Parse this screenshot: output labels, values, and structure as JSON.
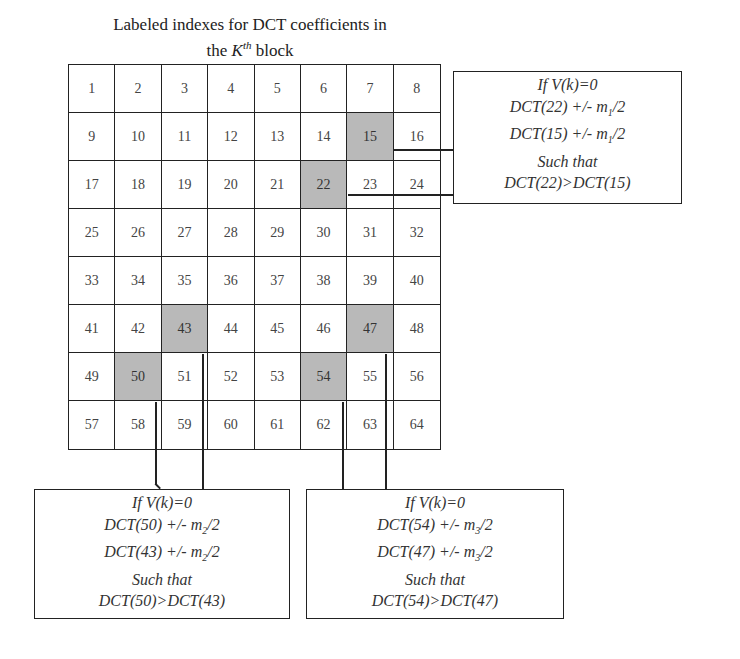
{
  "title": {
    "line1": "Labeled indexes for DCT coefficients in",
    "line2_prefix": "the ",
    "line2_var": "K",
    "line2_sup": "th",
    "line2_suffix": " block"
  },
  "grid": {
    "rows": 8,
    "cols": 8,
    "cells": [
      "1",
      "2",
      "3",
      "4",
      "5",
      "6",
      "7",
      "8",
      "9",
      "10",
      "11",
      "12",
      "13",
      "14",
      "15",
      "16",
      "17",
      "18",
      "19",
      "20",
      "21",
      "22",
      "23",
      "24",
      "25",
      "26",
      "27",
      "28",
      "29",
      "30",
      "31",
      "32",
      "33",
      "34",
      "35",
      "36",
      "37",
      "38",
      "39",
      "40",
      "41",
      "42",
      "43",
      "44",
      "45",
      "46",
      "47",
      "48",
      "49",
      "50",
      "51",
      "52",
      "53",
      "54",
      "55",
      "56",
      "57",
      "58",
      "59",
      "60",
      "61",
      "62",
      "63",
      "64"
    ],
    "shaded": [
      "15",
      "22",
      "43",
      "47",
      "50",
      "54"
    ],
    "shade_color": "#b9b9b9"
  },
  "boxes": {
    "pair1": {
      "cond": "If V(k)=0",
      "l2_a": "DCT(22) +/- m",
      "l2_sub": "1",
      "l2_b": "/2",
      "l3_a": "DCT(15) +/- m",
      "l3_sub": "1",
      "l3_b": "/2",
      "l4": "Such that",
      "l5": "DCT(22)>DCT(15)"
    },
    "pair2": {
      "cond": "If V(k)=0",
      "l2_a": "DCT(50) +/- m",
      "l2_sub": "2",
      "l2_b": "/2",
      "l3_a": "DCT(43) +/- m",
      "l3_sub": "2",
      "l3_b": "/2",
      "l4": "Such that",
      "l5": "DCT(50)>DCT(43)"
    },
    "pair3": {
      "cond": "If V(k)=0",
      "l2_a": "DCT(54) +/- m",
      "l2_sub": "3",
      "l2_b": "/2",
      "l3_a": "DCT(47) +/- m",
      "l3_sub": "3",
      "l3_b": "/2",
      "l4": "Such that",
      "l5": "DCT(54)>DCT(47)"
    }
  }
}
